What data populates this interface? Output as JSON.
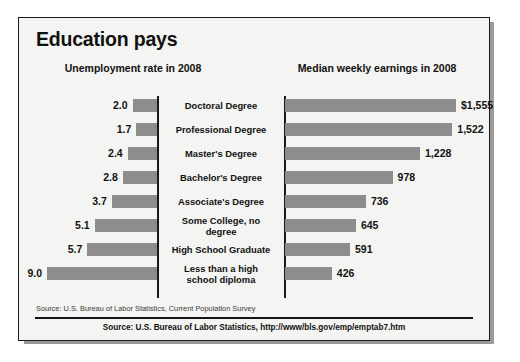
{
  "title": "Education pays",
  "headers": {
    "left": "Unemployment rate in 2008",
    "right": "Median weekly earnings in 2008"
  },
  "footer": {
    "source_note": "Source: U.S. Bureau of Labor Statistics, Current Population Survey",
    "source_bold": "Source: U.S. Bureau of Labor Statistics, http://www/bls.gov/emp/emptab7.htm"
  },
  "colors": {
    "bar": "#8d8d8d",
    "axis": "#1a1a1a",
    "card_background": "#f4f4f2",
    "text": "#111111"
  },
  "chart_data": {
    "type": "bar",
    "title": "Education pays",
    "orientation": "horizontal",
    "layout": "back-to-back dual bar chart, categories centered between panels",
    "grid": false,
    "legend": null,
    "categories": [
      "Doctoral Degree",
      "Professional Degree",
      "Master's Degree",
      "Bachelor's Degree",
      "Associate's Degree",
      "Some College, no degree",
      "High School Graduate",
      "Less than a high school diploma"
    ],
    "category_lines": [
      [
        "Doctoral Degree"
      ],
      [
        "Professional Degree"
      ],
      [
        "Master's Degree"
      ],
      [
        "Bachelor's Degree"
      ],
      [
        "Associate's Degree"
      ],
      [
        "Some College, no",
        "degree"
      ],
      [
        "High School Graduate"
      ],
      [
        "Less than a high",
        "school diploma"
      ]
    ],
    "series": [
      {
        "name": "Unemployment rate in 2008",
        "unit": "percent",
        "direction": "left",
        "xlabel": "Unemployment rate in 2008",
        "xlim": [
          0,
          9.0
        ],
        "values": [
          2.0,
          1.7,
          2.4,
          2.8,
          3.7,
          5.1,
          5.7,
          9.0
        ],
        "labels": [
          "2.0",
          "1.7",
          "2.4",
          "2.8",
          "3.7",
          "5.1",
          "5.7",
          "9.0"
        ]
      },
      {
        "name": "Median weekly earnings in 2008",
        "unit": "dollars per week",
        "direction": "right",
        "xlabel": "Median weekly earnings in 2008",
        "xlim": [
          0,
          1555
        ],
        "values": [
          1555,
          1522,
          1228,
          978,
          736,
          645,
          591,
          426
        ],
        "labels": [
          "$1,555",
          "1,522",
          "1,228",
          "978",
          "736",
          "645",
          "591",
          "426"
        ]
      }
    ]
  }
}
